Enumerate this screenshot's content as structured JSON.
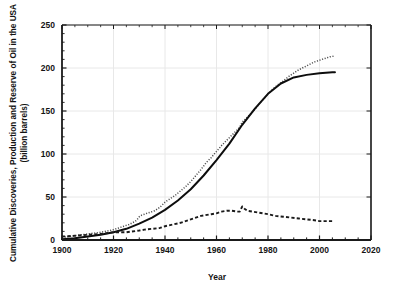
{
  "chart_data": {
    "type": "line",
    "title": "",
    "xlabel": "Year",
    "ylabel": "Cumulative Discoveries, Production and Reserve of Oil in the USA (billion barrels)",
    "ylabel_line1": "Cumulative Discoveries, Production and Reserve of Oil in the USA",
    "ylabel_line2": "(billion barrels)",
    "xlim": [
      1900,
      2020
    ],
    "ylim": [
      0,
      250
    ],
    "xticks": [
      1900,
      1920,
      1940,
      1960,
      1980,
      2000,
      2020
    ],
    "xtick_labels": [
      "1900",
      "1920",
      "1940",
      "1960",
      "1980",
      "2000",
      "2020"
    ],
    "xminor_interval": 5,
    "yticks": [
      0,
      50,
      100,
      150,
      200,
      250
    ],
    "ytick_labels": [
      "0",
      "50",
      "100",
      "150",
      "200",
      "250"
    ],
    "yminor_interval": 10,
    "grid": true,
    "grid_color": "#e8e8e8",
    "legend": "none",
    "axis_color": "#1a1a1a",
    "series": [
      {
        "name": "Cumulative Discoveries",
        "style": "dotted",
        "color": "#4d4d4d",
        "x": [
          1900,
          1905,
          1910,
          1915,
          1920,
          1922,
          1924,
          1926,
          1928,
          1929,
          1930,
          1931,
          1932,
          1934,
          1936,
          1938,
          1940,
          1942,
          1944,
          1946,
          1948,
          1950,
          1952,
          1954,
          1956,
          1958,
          1960,
          1962,
          1964,
          1966,
          1968,
          1969,
          1970,
          1971,
          1972,
          1974,
          1976,
          1978,
          1980,
          1982,
          1984,
          1986,
          1988,
          1990,
          1992,
          1994,
          1996,
          1998,
          2000,
          2002,
          2004,
          2006
        ],
        "values": [
          3,
          5,
          7,
          9,
          12,
          14,
          16,
          18,
          21,
          23,
          27,
          29,
          30,
          32,
          34,
          38,
          44,
          48,
          52,
          57,
          62,
          68,
          75,
          82,
          90,
          96,
          103,
          110,
          116,
          122,
          128,
          131,
          137,
          140,
          143,
          149,
          156,
          163,
          170,
          176,
          181,
          185,
          190,
          194,
          198,
          201,
          204,
          207,
          209,
          211,
          213,
          214
        ]
      },
      {
        "name": "Cumulative Production",
        "style": "solid",
        "color": "#0d0d0d",
        "x": [
          1900,
          1905,
          1910,
          1915,
          1920,
          1925,
          1930,
          1935,
          1940,
          1945,
          1950,
          1955,
          1960,
          1965,
          1970,
          1975,
          1980,
          1985,
          1990,
          1995,
          2000,
          2005,
          2006
        ],
        "values": [
          1,
          2,
          4,
          6,
          9,
          13,
          19,
          26,
          35,
          46,
          59,
          75,
          93,
          112,
          134,
          153,
          170,
          182,
          189,
          192,
          194,
          195,
          195
        ]
      },
      {
        "name": "Reserve",
        "style": "dashed",
        "color": "#1a1a1a",
        "x": [
          1900,
          1905,
          1910,
          1915,
          1920,
          1925,
          1930,
          1932,
          1935,
          1938,
          1940,
          1943,
          1946,
          1950,
          1954,
          1958,
          1960,
          1962,
          1964,
          1966,
          1968,
          1969,
          1970,
          1971,
          1972,
          1974,
          1976,
          1978,
          1980,
          1983,
          1986,
          1989,
          1992,
          1995,
          1998,
          2000,
          2002,
          2004,
          2005
        ],
        "values": [
          4,
          5,
          6,
          7,
          9,
          9,
          11,
          12,
          13,
          14,
          16,
          18,
          20,
          24,
          28,
          30,
          31,
          33,
          34,
          34,
          33,
          33,
          39,
          36,
          34,
          33,
          32,
          31,
          30,
          28,
          27,
          26,
          25,
          24,
          23,
          22,
          22,
          22,
          22
        ]
      }
    ]
  }
}
